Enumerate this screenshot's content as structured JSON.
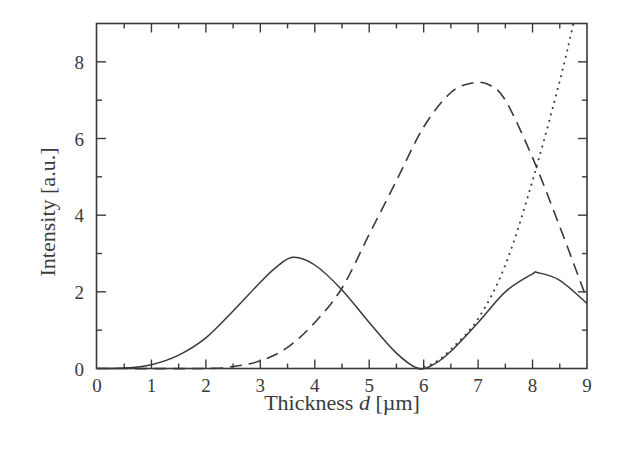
{
  "chart_data": {
    "type": "line",
    "title": "",
    "xlabel": "Thickness d [µm]",
    "xlabel_parts": {
      "prefix": "Thickness ",
      "var": "d",
      "suffix": " [µm]"
    },
    "ylabel": "Intensity [a.u.]",
    "xlim": [
      0,
      9
    ],
    "ylim": [
      0,
      9
    ],
    "x_ticks": [
      0,
      1,
      2,
      3,
      4,
      5,
      6,
      7,
      8,
      9
    ],
    "x_tick_labels": [
      "0",
      "1",
      "2",
      "3",
      "4",
      "5",
      "6",
      "7",
      "8",
      "9"
    ],
    "y_ticks": [
      0,
      2,
      4,
      6,
      8
    ],
    "y_tick_labels": [
      "0",
      "2",
      "4",
      "6",
      "8"
    ],
    "minor_ticks": true,
    "grid": false,
    "legend": null,
    "series": [
      {
        "name": "solid",
        "style": "solid",
        "x": [
          0,
          0.5,
          1,
          1.5,
          2,
          2.5,
          3,
          3.3,
          3.6,
          4,
          4.5,
          5,
          5.5,
          5.9,
          6.2,
          6.5,
          7,
          7.5,
          8,
          8.1,
          8.5,
          9
        ],
        "y": [
          0,
          0.01,
          0.1,
          0.35,
          0.8,
          1.5,
          2.25,
          2.65,
          2.9,
          2.7,
          2.05,
          1.2,
          0.4,
          0,
          0.12,
          0.45,
          1.2,
          2.0,
          2.47,
          2.5,
          2.3,
          1.7
        ]
      },
      {
        "name": "dashed",
        "style": "dashed",
        "x": [
          0,
          2,
          2.5,
          3,
          3.5,
          4,
          4.5,
          5,
          5.5,
          6,
          6.5,
          6.9,
          7.2,
          7.5,
          8,
          8.5,
          9
        ],
        "y": [
          0,
          0,
          0.05,
          0.2,
          0.55,
          1.2,
          2.1,
          3.5,
          4.9,
          6.3,
          7.2,
          7.45,
          7.4,
          7.0,
          5.5,
          3.7,
          1.8
        ]
      },
      {
        "name": "dotted",
        "style": "dotted",
        "x": [
          5.9,
          6.2,
          6.5,
          7,
          7.5,
          8,
          8.5,
          8.75
        ],
        "y": [
          0,
          0.15,
          0.5,
          1.3,
          2.7,
          4.9,
          7.5,
          9.0
        ]
      }
    ]
  },
  "colors": {
    "line": "#3a3a3a",
    "axis": "#3a3a3a",
    "background": "#ffffff"
  }
}
